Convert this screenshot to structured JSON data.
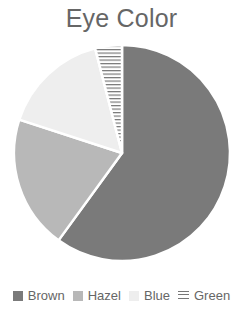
{
  "title": "Eye Color",
  "colors": {
    "brown": "#7a7a7a",
    "hazel": "#b8b8b8",
    "blue": "#eeeeee",
    "green_line": "#777777",
    "title_text": "#666666"
  },
  "legend": [
    {
      "label": "Brown",
      "swatch": "#7a7a7a",
      "pattern": "solid"
    },
    {
      "label": "Hazel",
      "swatch": "#b8b8b8",
      "pattern": "solid"
    },
    {
      "label": "Blue",
      "swatch": "#eeeeee",
      "pattern": "solid"
    },
    {
      "label": "Green",
      "swatch": "#777777",
      "pattern": "horizontal-hatch"
    }
  ],
  "chart_data": {
    "type": "pie",
    "title": "Eye Color",
    "categories": [
      "Brown",
      "Hazel",
      "Blue",
      "Green"
    ],
    "values": [
      60,
      20,
      16,
      4
    ],
    "unit": "percent (estimated)",
    "start_angle": "12 o'clock, clockwise",
    "legend_position": "bottom",
    "patterns": [
      "solid",
      "solid",
      "solid",
      "horizontal-hatch"
    ]
  }
}
